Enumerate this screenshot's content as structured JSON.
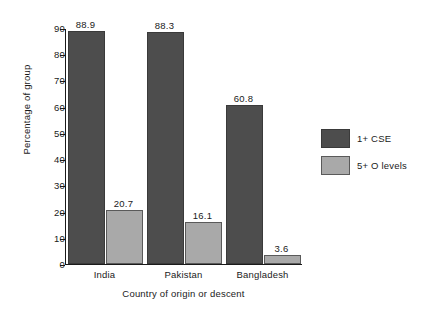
{
  "chart_data": {
    "type": "bar",
    "title": "",
    "xlabel": "Country of origin or descent",
    "ylabel": "Percentage of group",
    "categories": [
      "India",
      "Pakistan",
      "Bangladesh"
    ],
    "series": [
      {
        "name": "1+ CSE",
        "color": "#4d4d4d",
        "values": [
          88.9,
          88.3,
          60.8
        ]
      },
      {
        "name": "5+ O levels",
        "color": "#a9a9a9",
        "values": [
          20.7,
          16.1,
          3.6
        ]
      }
    ],
    "ylim": [
      0,
      90
    ],
    "yticks": [
      0,
      10,
      20,
      30,
      40,
      50,
      60,
      70,
      80,
      90
    ],
    "ytick_labels": [
      "0",
      "10",
      "20",
      "30",
      "40",
      "50",
      "60",
      "70",
      "80",
      "90"
    ],
    "grid": false,
    "legend_position": "right",
    "data_labels": [
      "88.9",
      "20.7",
      "88.3",
      "16.1",
      "60.8",
      "3.6"
    ]
  },
  "legend": {
    "items": [
      {
        "label": "1+ CSE"
      },
      {
        "label": "5+ O levels"
      }
    ]
  }
}
